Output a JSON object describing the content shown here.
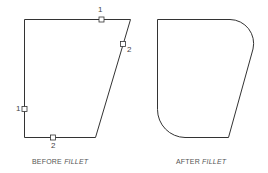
{
  "diagram": {
    "before": {
      "caption_plain": "BEFORE ",
      "caption_italic": "FILLET",
      "labels": {
        "top_1": "1",
        "slant_2": "2",
        "left_1": "1",
        "bottom_2": "2"
      }
    },
    "after": {
      "caption_plain": "AFTER ",
      "caption_italic": "FILLET"
    },
    "colors": {
      "stroke": "#333333",
      "text": "#555555",
      "background": "#ffffff"
    }
  }
}
